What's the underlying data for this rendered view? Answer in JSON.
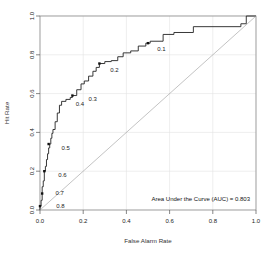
{
  "chart_data": {
    "type": "line",
    "title": "",
    "xlabel": "False Alarm Rate",
    "ylabel": "Hit Rate",
    "xlim": [
      0,
      1
    ],
    "ylim": [
      0,
      1
    ],
    "grid": true,
    "legend": null,
    "xticks": [
      "0.0",
      "0.2",
      "0.4",
      "0.6",
      "0.8",
      "1.0"
    ],
    "xtick_values": [
      0.0,
      0.2,
      0.4,
      0.6,
      0.8,
      1.0
    ],
    "yticks": [
      "0.0",
      "0.2",
      "0.4",
      "0.6",
      "0.8",
      "1.0"
    ],
    "ytick_values": [
      0.0,
      0.2,
      0.4,
      0.6,
      0.8,
      1.0
    ],
    "annotations": [
      {
        "text": "Area Under the Curve (AUC) = 0.803",
        "x": 0.97,
        "y": 0.045,
        "align": "end"
      }
    ],
    "series": [
      {
        "name": "ROC curve",
        "color": "#222222",
        "x": [
          0.0,
          0.0,
          0.005,
          0.005,
          0.01,
          0.01,
          0.01,
          0.015,
          0.015,
          0.02,
          0.02,
          0.025,
          0.025,
          0.03,
          0.03,
          0.035,
          0.035,
          0.04,
          0.04,
          0.045,
          0.045,
          0.05,
          0.05,
          0.055,
          0.055,
          0.06,
          0.06,
          0.07,
          0.07,
          0.08,
          0.08,
          0.09,
          0.09,
          0.1,
          0.1,
          0.12,
          0.12,
          0.14,
          0.14,
          0.15,
          0.15,
          0.17,
          0.17,
          0.19,
          0.19,
          0.205,
          0.205,
          0.225,
          0.225,
          0.245,
          0.245,
          0.26,
          0.26,
          0.275,
          0.275,
          0.3,
          0.3,
          0.33,
          0.33,
          0.36,
          0.36,
          0.385,
          0.385,
          0.42,
          0.42,
          0.455,
          0.455,
          0.49,
          0.49,
          0.51,
          0.51,
          0.57,
          0.57,
          0.62,
          0.62,
          0.71,
          0.71,
          0.93,
          0.93,
          0.955,
          0.955,
          1.0
        ],
        "y": [
          0.0,
          0.02,
          0.02,
          0.05,
          0.05,
          0.085,
          0.12,
          0.12,
          0.15,
          0.15,
          0.2,
          0.2,
          0.225,
          0.225,
          0.26,
          0.26,
          0.29,
          0.29,
          0.32,
          0.32,
          0.34,
          0.34,
          0.37,
          0.37,
          0.395,
          0.395,
          0.415,
          0.415,
          0.455,
          0.455,
          0.5,
          0.5,
          0.54,
          0.54,
          0.56,
          0.56,
          0.57,
          0.57,
          0.58,
          0.58,
          0.59,
          0.59,
          0.62,
          0.62,
          0.65,
          0.65,
          0.665,
          0.665,
          0.69,
          0.69,
          0.715,
          0.715,
          0.735,
          0.735,
          0.755,
          0.755,
          0.765,
          0.765,
          0.77,
          0.77,
          0.79,
          0.79,
          0.81,
          0.81,
          0.82,
          0.82,
          0.845,
          0.845,
          0.86,
          0.86,
          0.87,
          0.87,
          0.905,
          0.905,
          0.915,
          0.915,
          0.945,
          0.945,
          0.96,
          0.96,
          1.0,
          1.0
        ]
      },
      {
        "name": "chance diagonal",
        "color": "#9a9a9a",
        "x": [
          0,
          1
        ],
        "y": [
          0,
          1
        ]
      }
    ],
    "threshold_markers": [
      {
        "label": "0.1",
        "point_x": 0.5,
        "point_y": 0.86,
        "label_x": 0.543,
        "label_y": 0.828
      },
      {
        "label": "0.2",
        "point_x": 0.275,
        "point_y": 0.755,
        "label_x": 0.325,
        "label_y": 0.722
      },
      {
        "label": "0.3",
        "point_x": null,
        "point_y": null,
        "label_x": 0.225,
        "label_y": 0.573
      },
      {
        "label": "0.4",
        "point_x": 0.15,
        "point_y": 0.59,
        "label_x": 0.165,
        "label_y": 0.548
      },
      {
        "label": "0.5",
        "point_x": 0.04,
        "point_y": 0.34,
        "label_x": 0.1,
        "label_y": 0.322
      },
      {
        "label": "0.6",
        "point_x": 0.02,
        "point_y": 0.2,
        "label_x": 0.085,
        "label_y": 0.18
      },
      {
        "label": "0.7",
        "point_x": 0.01,
        "point_y": 0.085,
        "label_x": 0.072,
        "label_y": 0.09
      },
      {
        "label": "0.8",
        "point_x": 0.0,
        "point_y": 0.02,
        "label_x": 0.075,
        "label_y": 0.02
      }
    ]
  }
}
